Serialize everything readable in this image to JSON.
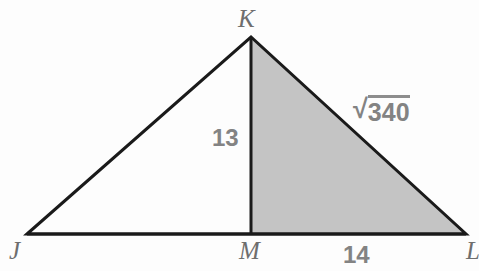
{
  "figure": {
    "kind": "geometry-diagram",
    "canvas": {
      "width": 479,
      "height": 271
    },
    "colors": {
      "background": "#fdfdfd",
      "stroke": "#1a1a1a",
      "shaded_fill": "#c4c4c4",
      "vertex_label": "#6e6e6e",
      "measure_label": "#838383"
    },
    "stroke_width": 3,
    "points": {
      "J": {
        "x": 27,
        "y": 234
      },
      "K": {
        "x": 251,
        "y": 37
      },
      "L": {
        "x": 466,
        "y": 234
      },
      "M": {
        "x": 251,
        "y": 234
      }
    },
    "segments": [
      {
        "name": "JK",
        "from": "J",
        "to": "K"
      },
      {
        "name": "KL",
        "from": "K",
        "to": "L"
      },
      {
        "name": "JL",
        "from": "J",
        "to": "L"
      },
      {
        "name": "KM",
        "from": "K",
        "to": "M"
      }
    ],
    "shaded_region": {
      "name": "triangle-KML",
      "vertices": [
        "K",
        "M",
        "L"
      ]
    },
    "vertex_labels": [
      {
        "id": "K",
        "text": "K"
      },
      {
        "id": "J",
        "text": "J"
      },
      {
        "id": "M",
        "text": "M"
      },
      {
        "id": "L",
        "text": "L"
      }
    ],
    "measure_labels": [
      {
        "id": "KM",
        "text": "13",
        "segment": "KM"
      },
      {
        "id": "ML",
        "text": "14",
        "segment": "ML"
      }
    ],
    "radical_label": {
      "id": "KL",
      "segment": "KL",
      "sign": "√",
      "radicand": "340",
      "text": "√340"
    }
  }
}
